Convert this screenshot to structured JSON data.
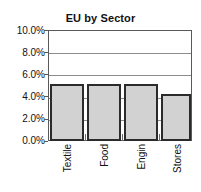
{
  "chart_data": {
    "type": "bar",
    "title": "EU by Sector",
    "xlabel": "",
    "ylabel": "",
    "categories": [
      "Textile",
      "Food",
      "Engin",
      "Stores"
    ],
    "values": [
      5.1,
      5.1,
      5.1,
      4.2
    ],
    "ylim": [
      0,
      10
    ],
    "ytick_values": [
      0,
      2,
      4,
      6,
      8,
      10
    ],
    "ytick_labels": [
      "0.0%",
      "2.0%",
      "4.0%",
      "6.0%",
      "8.0%",
      "10.0%"
    ],
    "value_labels": [
      "5.1%",
      "5.1%",
      "5.1%",
      "4.2%"
    ],
    "grid": true,
    "grid_axis": "y",
    "legend": false,
    "legend_position": "none",
    "colors": {
      "bar_fill": "#d2d2d2",
      "bar_border": "#2b2b2b",
      "gridline": "#8d8d8d",
      "axis": "#5a5a5a",
      "text": "#111111",
      "background": "#ffffff"
    }
  }
}
